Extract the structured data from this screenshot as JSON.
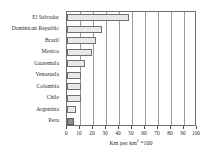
{
  "chart_data": {
    "type": "bar",
    "orientation": "horizontal",
    "title": "",
    "subtitle": "",
    "xlabel": "Km per km² *100",
    "ylabel": "",
    "categories": [
      "El Salvador",
      "Dominican Republic",
      "Brazil",
      "Mexico",
      "Guatemala",
      "Venezuela",
      "Colombia",
      "Chile",
      "Argentina",
      "Peru"
    ],
    "values": [
      48,
      27,
      22,
      19,
      14,
      11,
      11,
      11,
      7,
      5
    ],
    "xlim": [
      0,
      100
    ],
    "xticks": [
      0,
      10,
      20,
      30,
      40,
      50,
      60,
      70,
      80,
      90,
      100
    ],
    "xticklabels": [
      "0",
      "10",
      "20",
      "30",
      "40",
      "50",
      "60",
      "70",
      "80",
      "90",
      "100"
    ],
    "grid": "vertical",
    "legend": "none",
    "bar_fill": "#e9e9e9",
    "bar_border": "#707070",
    "highlight_category": "Peru",
    "highlight_fill": "#8f8f8f",
    "frame_color": "#6e6e6e",
    "background": "#ffffff",
    "units_note": "Km per km² *100"
  },
  "axis_title": {
    "prefix": "Km per km",
    "superscript": "2",
    "suffix": " *100"
  }
}
